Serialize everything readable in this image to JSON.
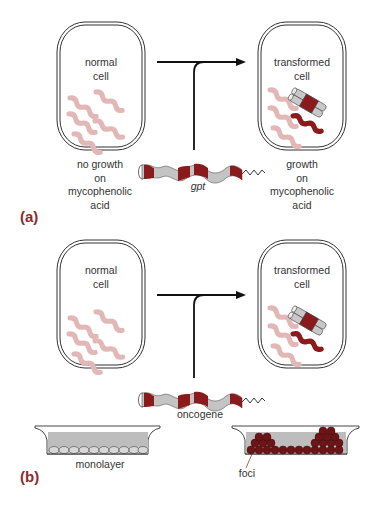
{
  "figure": {
    "panel_a": {
      "label": "(a)",
      "left_cell": {
        "title_line1": "normal",
        "title_line2": "cell",
        "caption": [
          "no growth",
          "on",
          "mycophenolic",
          "acid"
        ]
      },
      "right_cell": {
        "title_line1": "transformed",
        "title_line2": "cell",
        "caption": [
          "growth",
          "on",
          "mycophenolic",
          "acid"
        ]
      },
      "gene_label": "gpt"
    },
    "panel_b": {
      "label": "(b)",
      "left_cell": {
        "title_line1": "normal",
        "title_line2": "cell"
      },
      "right_cell": {
        "title_line1": "transformed",
        "title_line2": "cell"
      },
      "gene_label": "oncogene",
      "dish_left_label": "monolayer",
      "dish_right_label": "foci"
    },
    "colors": {
      "chromosome_pink": "#e2b8b6",
      "dark_red": "#8b1a1c",
      "dna_gray": "#c4c4c4",
      "medium_gray": "#bdbdbd",
      "label_red": "#8e2a2c"
    }
  }
}
